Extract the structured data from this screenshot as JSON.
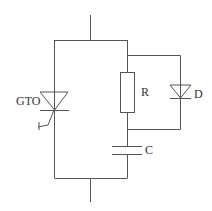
{
  "diagram": {
    "type": "circuit-schematic",
    "components": [
      {
        "id": "gto",
        "kind": "gate-turn-off-thyristor",
        "label": "GTO"
      },
      {
        "id": "r",
        "kind": "resistor",
        "label": "R"
      },
      {
        "id": "d",
        "kind": "diode",
        "label": "D"
      },
      {
        "id": "c",
        "kind": "capacitor",
        "label": "C"
      }
    ],
    "gate_mark": "+",
    "colors": {
      "line": "#555555",
      "text": "#333333",
      "background": "#ffffff"
    }
  }
}
